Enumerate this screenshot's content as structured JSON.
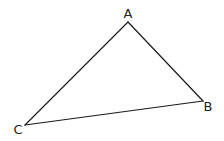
{
  "diagram": {
    "type": "triangle",
    "stroke_color": "#1a1a1a",
    "label_color": "#222222",
    "vertices": [
      {
        "id": "A",
        "label": "A",
        "x": 128,
        "y": 22,
        "label_x": 128,
        "label_y": 18,
        "anchor": "middle"
      },
      {
        "id": "B",
        "label": "B",
        "x": 203,
        "y": 101,
        "label_x": 208,
        "label_y": 111,
        "anchor": "middle"
      },
      {
        "id": "C",
        "label": "C",
        "x": 25,
        "y": 125,
        "label_x": 18,
        "label_y": 134,
        "anchor": "middle"
      }
    ],
    "edges": [
      {
        "from": "A",
        "to": "B"
      },
      {
        "from": "B",
        "to": "C"
      },
      {
        "from": "C",
        "to": "A"
      }
    ]
  }
}
